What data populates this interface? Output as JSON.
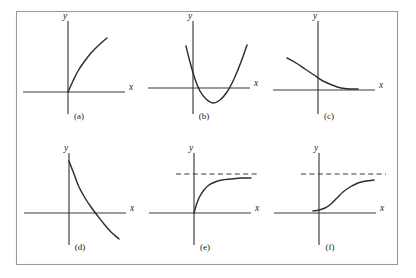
{
  "figure": {
    "name": "six-graph-panels",
    "frame": {
      "x": 16,
      "y": 11,
      "width": 382,
      "height": 254,
      "stroke": "#9a9a9a"
    },
    "colors": {
      "axis": "#3a3a3a",
      "curve": "#2e2e2e",
      "asymptote": "#3a3a3a",
      "frame": "#9a9a9a",
      "background": "#ffffff",
      "text": "#222222"
    }
  },
  "chart_data": [
    {
      "id": "panel-a",
      "type": "line",
      "label": "(a)",
      "xlabel": "x",
      "ylabel": "y",
      "grid": false,
      "legend": false,
      "shape": "increasing-concave-down from origin",
      "origin_px": {
        "x": 68,
        "y": 92
      },
      "x_axis_px": {
        "x1": 23,
        "x2": 125,
        "y": 92
      },
      "y_axis_px": {
        "x": 68,
        "y1": 21,
        "y2": 114
      },
      "x_label_px": {
        "x": 129,
        "y": 90
      },
      "y_label_px": {
        "x": 65,
        "y": 19
      },
      "label_px": {
        "x": 79,
        "y": 119
      },
      "points": [
        [
          68,
          92
        ],
        [
          73,
          81
        ],
        [
          78,
          71
        ],
        [
          84,
          62
        ],
        [
          91,
          53
        ],
        [
          99,
          45
        ],
        [
          107,
          38
        ]
      ]
    },
    {
      "id": "panel-b",
      "type": "line",
      "label": "(b)",
      "xlabel": "x",
      "ylabel": "y",
      "grid": false,
      "legend": false,
      "shape": "upward parabola with vertex below x-axis, two roots",
      "origin_px": {
        "x": 193,
        "y": 88
      },
      "x_axis_px": {
        "x1": 148,
        "x2": 250,
        "y": 88
      },
      "y_axis_px": {
        "x": 193,
        "y1": 21,
        "y2": 114
      },
      "x_label_px": {
        "x": 254,
        "y": 86
      },
      "y_label_px": {
        "x": 190,
        "y": 19
      },
      "label_px": {
        "x": 204,
        "y": 119
      },
      "vertex_px": {
        "x": 213,
        "y": 103
      },
      "roots_px": [
        195,
        231
      ],
      "points": [
        [
          186,
          46
        ],
        [
          190,
          62
        ],
        [
          195,
          79
        ],
        [
          200,
          91
        ],
        [
          206,
          99
        ],
        [
          213,
          103
        ],
        [
          220,
          100
        ],
        [
          227,
          92
        ],
        [
          234,
          79
        ],
        [
          241,
          62
        ],
        [
          247,
          45
        ]
      ]
    },
    {
      "id": "panel-c",
      "type": "line",
      "label": "(c)",
      "xlabel": "x",
      "ylabel": "y",
      "grid": false,
      "legend": false,
      "shape": "decreasing convex curve flattening toward x-axis",
      "origin_px": {
        "x": 318,
        "y": 90
      },
      "x_axis_px": {
        "x1": 273,
        "x2": 375,
        "y": 90
      },
      "y_axis_px": {
        "x": 318,
        "y1": 21,
        "y2": 114
      },
      "x_label_px": {
        "x": 379,
        "y": 88
      },
      "y_label_px": {
        "x": 315,
        "y": 19
      },
      "label_px": {
        "x": 329,
        "y": 119
      },
      "points": [
        [
          287,
          58
        ],
        [
          296,
          63
        ],
        [
          305,
          69
        ],
        [
          314,
          75
        ],
        [
          323,
          81
        ],
        [
          332,
          85
        ],
        [
          341,
          88
        ],
        [
          350,
          89
        ],
        [
          358,
          89
        ]
      ]
    },
    {
      "id": "panel-d",
      "type": "line",
      "label": "(d)",
      "xlabel": "x",
      "ylabel": "y",
      "grid": false,
      "legend": false,
      "shape": "steeply decreasing curve crossing x-axis",
      "origin_px": {
        "x": 69,
        "y": 213
      },
      "x_axis_px": {
        "x1": 24,
        "x2": 126,
        "y": 213
      },
      "y_axis_px": {
        "x": 69,
        "y1": 153,
        "y2": 245
      },
      "x_label_px": {
        "x": 130,
        "y": 211
      },
      "y_label_px": {
        "x": 66,
        "y": 151
      },
      "label_px": {
        "x": 80,
        "y": 250
      },
      "x_intercept_px": 96,
      "points": [
        [
          69,
          161
        ],
        [
          74,
          174
        ],
        [
          79,
          187
        ],
        [
          85,
          198
        ],
        [
          91,
          207
        ],
        [
          97,
          215
        ],
        [
          104,
          224
        ],
        [
          111,
          232
        ],
        [
          119,
          239
        ]
      ]
    },
    {
      "id": "panel-e",
      "type": "line",
      "label": "(e)",
      "xlabel": "x",
      "ylabel": "y",
      "grid": false,
      "legend": false,
      "shape": "increasing concave-down curve from origin approaching horizontal asymptote",
      "origin_px": {
        "x": 194,
        "y": 213
      },
      "x_axis_px": {
        "x1": 149,
        "x2": 251,
        "y": 213
      },
      "y_axis_px": {
        "x": 194,
        "y1": 153,
        "y2": 245
      },
      "x_label_px": {
        "x": 255,
        "y": 211
      },
      "y_label_px": {
        "x": 191,
        "y": 151
      },
      "label_px": {
        "x": 205,
        "y": 250
      },
      "asymptote_px": {
        "x1": 176,
        "x2": 260,
        "y": 174
      },
      "points": [
        [
          194,
          213
        ],
        [
          197,
          203
        ],
        [
          200,
          196
        ],
        [
          204,
          190
        ],
        [
          209,
          185
        ],
        [
          215,
          182
        ],
        [
          222,
          180
        ],
        [
          231,
          179
        ],
        [
          241,
          178
        ],
        [
          251,
          178
        ]
      ]
    },
    {
      "id": "panel-f",
      "type": "line",
      "label": "(f)",
      "xlabel": "x",
      "ylabel": "y",
      "grid": false,
      "legend": false,
      "shape": "sigmoid S-shaped curve approaching horizontal asymptote",
      "origin_px": {
        "x": 319,
        "y": 213
      },
      "x_axis_px": {
        "x1": 274,
        "x2": 376,
        "y": 213
      },
      "y_axis_px": {
        "x": 319,
        "y1": 153,
        "y2": 245
      },
      "x_label_px": {
        "x": 380,
        "y": 211
      },
      "y_label_px": {
        "x": 316,
        "y": 151
      },
      "label_px": {
        "x": 330,
        "y": 250
      },
      "asymptote_px": {
        "x1": 301,
        "x2": 386,
        "y": 174
      },
      "points": [
        [
          313,
          211
        ],
        [
          319,
          210
        ],
        [
          325,
          208
        ],
        [
          331,
          204
        ],
        [
          337,
          198
        ],
        [
          343,
          192
        ],
        [
          350,
          187
        ],
        [
          358,
          183
        ],
        [
          366,
          181
        ],
        [
          374,
          180
        ]
      ]
    }
  ]
}
